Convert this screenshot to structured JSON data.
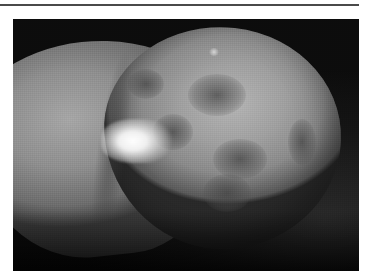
{
  "page": {
    "top_rule": {
      "color": "#4a4a4a"
    },
    "figure": {
      "type": "grayscale clinical photograph",
      "description": "Close-up grayscale photograph showing a rounded lesion-bearing tissue surface with darker mottled patches and a bright specular highlight",
      "colors": {
        "background": "#141414",
        "tissue_light": "#b4b4b4",
        "tissue_mid": "#8f8f8f",
        "patch_dark": "#464646",
        "highlight": "#ffffff"
      }
    }
  }
}
